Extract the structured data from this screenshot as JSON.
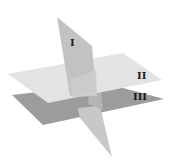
{
  "diagram": {
    "type": "intersecting-planes",
    "planes": [
      {
        "label": "I",
        "orientation": "vertical",
        "color": "#c4c4c4"
      },
      {
        "label": "II",
        "orientation": "horizontal-upper",
        "color": "#e2e2e2"
      },
      {
        "label": "III",
        "orientation": "horizontal-lower",
        "color": "#9c9c9c"
      }
    ]
  }
}
